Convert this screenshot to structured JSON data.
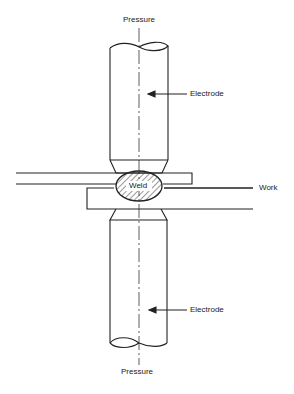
{
  "diagram": {
    "type": "resistance spot welding schematic",
    "labels": {
      "pressure_top": "Pressure",
      "electrode_top": "Electrode",
      "weld": "Weld",
      "work": "Work",
      "electrode_bottom": "Electrode",
      "pressure_bottom": "Pressure"
    },
    "colors": {
      "line": "#222222",
      "background": "#ffffff"
    }
  }
}
